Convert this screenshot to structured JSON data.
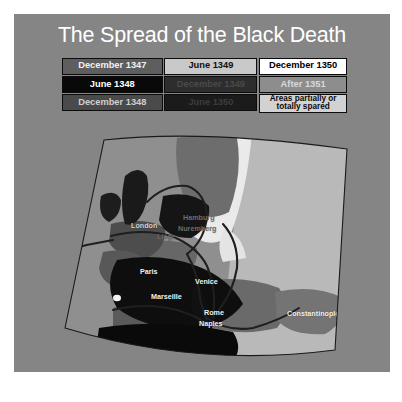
{
  "slide": {
    "title": "The Spread of the Black Death",
    "background_color": "#858585",
    "title_color": "#ffffff"
  },
  "legend": {
    "rows": [
      [
        {
          "label": "December 1347",
          "bg": "#5e5e5e",
          "fg": "#f0f0f0"
        },
        {
          "label": "June 1349",
          "bg": "#c9c9c9",
          "fg": "#101010"
        },
        {
          "label": "December 1350",
          "bg": "#ffffff",
          "fg": "#000000"
        }
      ],
      [
        {
          "label": "June 1348",
          "bg": "#090909",
          "fg": "#ffffff"
        },
        {
          "label": "December 1349",
          "bg": "#2d2d2d",
          "fg": "#4a4a4a"
        },
        {
          "label": "After 1351",
          "bg": "#8d8d8d",
          "fg": "#d9d9d9"
        }
      ],
      [
        {
          "label": "December 1348",
          "bg": "#4a4a4a",
          "fg": "#cfcfcf"
        },
        {
          "label": "June 1350",
          "bg": "#1b1b1b",
          "fg": "#3d3d3d"
        },
        {
          "label": "Areas partially or totally spared",
          "bg": "#d2d2d2",
          "fg": "#0a0a0a"
        }
      ]
    ],
    "border_color": "#0c0c0c"
  },
  "trade_routes_key": {
    "label": "Major trade routes",
    "swatch_color": "#2a2a2a"
  },
  "map": {
    "ocean_color": "#8f8f8f",
    "frame_color": "#1a1a1a",
    "route_color": "#1f1f1f",
    "cities": [
      {
        "name": "London",
        "x": 84,
        "y": 96,
        "tone": "dark"
      },
      {
        "name": "Hamburg",
        "x": 136,
        "y": 88,
        "tone": "faint"
      },
      {
        "name": "Nuremberg",
        "x": 131,
        "y": 99,
        "tone": "faint"
      },
      {
        "name": "Liège",
        "x": 110,
        "y": 107,
        "tone": "faint"
      },
      {
        "name": "Paris",
        "x": 93,
        "y": 142,
        "tone": "default"
      },
      {
        "name": "Venice",
        "x": 148,
        "y": 152,
        "tone": "default"
      },
      {
        "name": "Marseille",
        "x": 104,
        "y": 167,
        "tone": "default"
      },
      {
        "name": "Rome",
        "x": 157,
        "y": 183,
        "tone": "default"
      },
      {
        "name": "Naples",
        "x": 152,
        "y": 194,
        "tone": "default"
      },
      {
        "name": "Constantinople",
        "x": 240,
        "y": 184,
        "tone": "default"
      }
    ]
  }
}
